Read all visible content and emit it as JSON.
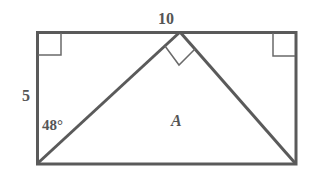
{
  "diagram": {
    "type": "geometry",
    "colors": {
      "stroke": "#5a5a5a",
      "text": "#555555",
      "background": "#ffffff"
    },
    "labels": {
      "top_length": "10",
      "side_length": "5",
      "angle": "48°",
      "region": "A"
    },
    "shapes": {
      "rectangle": {
        "x1": 37,
        "y1": 32,
        "x2": 296,
        "y2": 164
      },
      "triangle": {
        "apex": [
          180,
          32
        ],
        "left": [
          37,
          164
        ],
        "right": [
          296,
          164
        ]
      },
      "right_angle_markers": [
        "top-left corner",
        "top-right corner",
        "triangle apex"
      ]
    }
  }
}
